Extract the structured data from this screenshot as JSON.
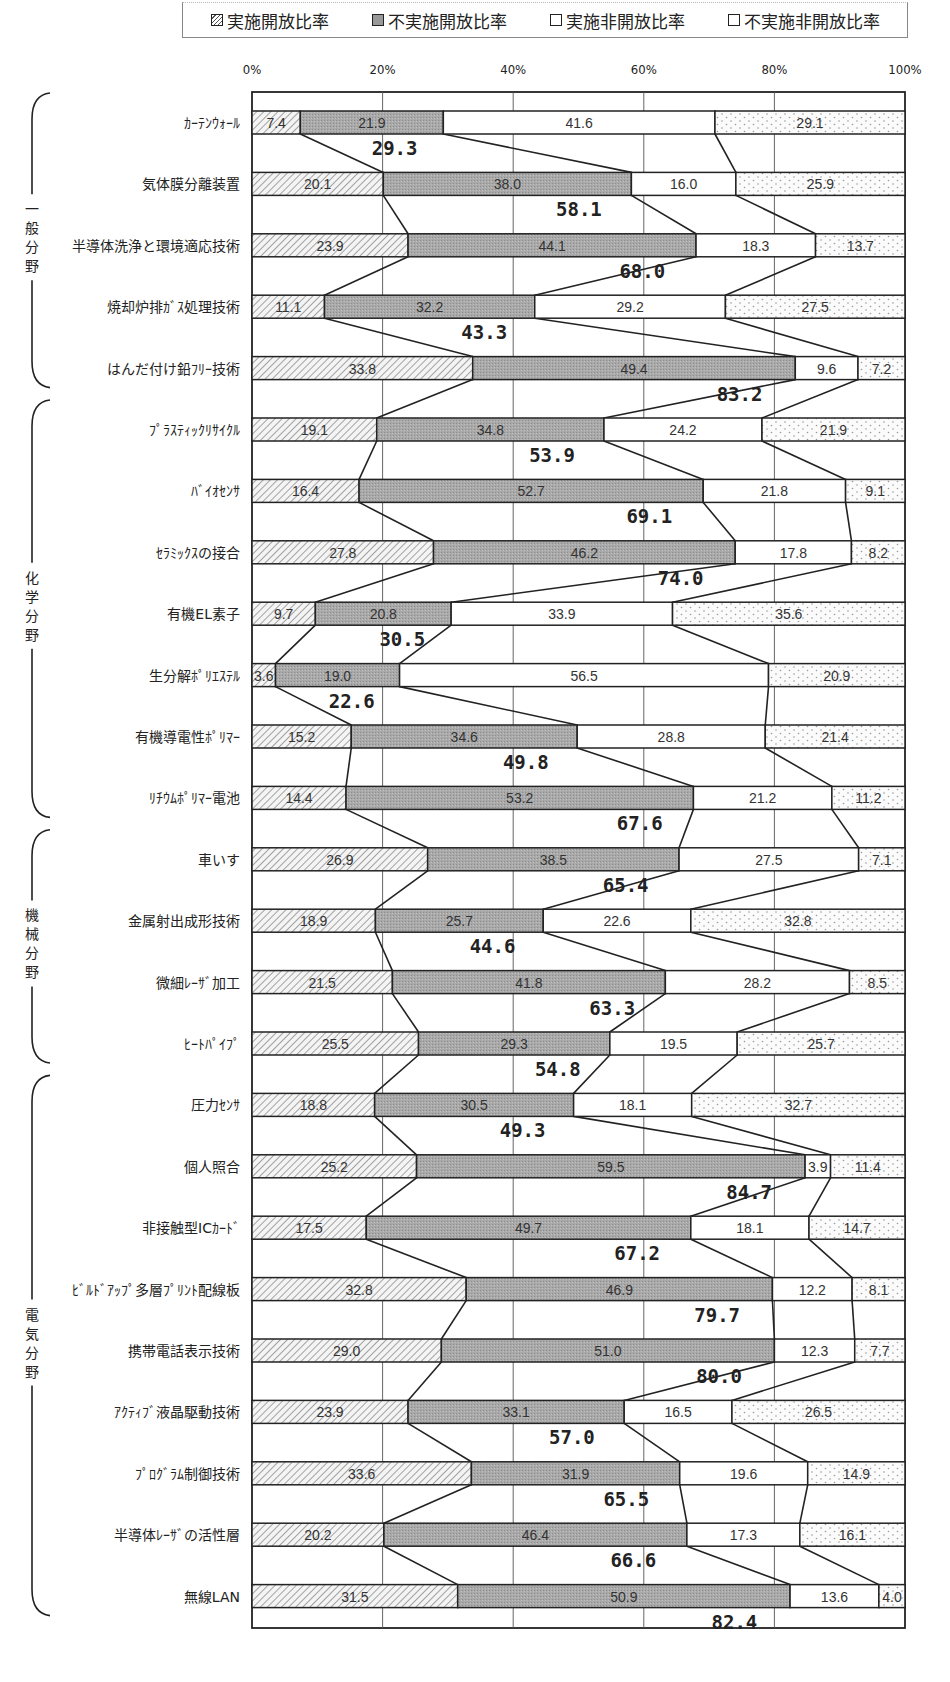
{
  "legend": {
    "items": [
      {
        "label": "実施開放比率",
        "pattern": "hatch"
      },
      {
        "label": "不実施開放比率",
        "pattern": "gray"
      },
      {
        "label": "実施非開放比率",
        "pattern": "white"
      },
      {
        "label": "不実施非開放比率",
        "pattern": "dots"
      }
    ]
  },
  "colors": {
    "hatch_fill": "#f2f2f2",
    "hatch_line": "#777777",
    "gray_fill": "#a8a8a8",
    "white_fill": "#ffffff",
    "dots_fill": "#fafafa",
    "dots_color": "#9a9a9a",
    "line": "#222222",
    "grid": "#444444"
  },
  "chart_data": {
    "type": "bar",
    "orientation": "horizontal",
    "stacked": "percent",
    "title": "",
    "xlabel": "",
    "ylabel": "",
    "xlim": [
      0,
      100
    ],
    "x_ticks": [
      "0%",
      "20%",
      "40%",
      "60%",
      "80%",
      "100%"
    ],
    "grid": true,
    "legend_position": "top",
    "series_names": [
      "実施開放比率",
      "不実施開放比率",
      "実施非開放比率",
      "不実施非開放比率"
    ],
    "annotation": "Bold numbers below each bar = 実施開放比率 + 不実施開放比率 (開放比率合計)",
    "groups": [
      {
        "label": "一般分野",
        "start": 0,
        "end": 4
      },
      {
        "label": "化学分野",
        "start": 5,
        "end": 11
      },
      {
        "label": "機械分野",
        "start": 12,
        "end": 15
      },
      {
        "label": "電気分野",
        "start": 16,
        "end": 24
      }
    ],
    "categories": [
      "ｶｰﾃﾝｳｫｰﾙ",
      "気体膜分離装置",
      "半導体洗浄と環境適応技術",
      "焼却炉排ｶﾞｽ処理技術",
      "はんだ付け鉛ﾌﾘｰ技術",
      "ﾌﾟﾗｽﾃｨｯｸﾘｻｲｸﾙ",
      "ﾊﾞｲｵｾﾝｻ",
      "ｾﾗﾐｯｸｽの接合",
      "有機EL素子",
      "生分解ﾎﾟﾘｴｽﾃﾙ",
      "有機導電性ﾎﾟﾘﾏｰ",
      "ﾘﾁｳﾑﾎﾟﾘﾏｰ電池",
      "車いす",
      "金属射出成形技術",
      "微細ﾚｰｻﾞ加工",
      "ﾋｰﾄﾊﾟｲﾌﾟ",
      "圧力ｾﾝｻ",
      "個人照合",
      "非接触型ICｶｰﾄﾞ",
      "ﾋﾞﾙﾄﾞｱｯﾌﾟ多層ﾌﾟﾘﾝﾄ配線板",
      "携帯電話表示技術",
      "ｱｸﾃｨﾌﾞ液晶駆動技術",
      "ﾌﾟﾛｸﾞﾗﾑ制御技術",
      "半導体ﾚｰｻﾞの活性層",
      "無線LAN"
    ],
    "series": [
      {
        "name": "実施開放比率",
        "values": [
          7.4,
          20.1,
          23.9,
          11.1,
          33.8,
          19.1,
          16.4,
          27.8,
          9.7,
          3.6,
          15.2,
          14.4,
          26.9,
          18.9,
          21.5,
          25.5,
          18.8,
          25.2,
          17.5,
          32.8,
          29.0,
          23.9,
          33.6,
          20.2,
          31.5
        ]
      },
      {
        "name": "不実施開放比率",
        "values": [
          21.9,
          38.0,
          44.1,
          32.2,
          49.4,
          34.8,
          52.7,
          46.2,
          20.8,
          19.0,
          34.6,
          53.2,
          38.5,
          25.7,
          41.8,
          29.3,
          30.5,
          59.5,
          49.7,
          46.9,
          51.0,
          33.1,
          31.9,
          46.4,
          50.9
        ]
      },
      {
        "name": "実施非開放比率",
        "values": [
          41.6,
          16.0,
          18.3,
          29.2,
          9.6,
          24.2,
          21.8,
          17.8,
          33.9,
          56.5,
          28.8,
          21.2,
          27.5,
          22.6,
          28.2,
          19.5,
          18.1,
          3.9,
          18.1,
          12.2,
          12.3,
          16.5,
          19.6,
          17.3,
          13.6
        ]
      },
      {
        "name": "不実施非開放比率",
        "values": [
          29.1,
          25.9,
          13.7,
          27.5,
          7.2,
          21.9,
          9.1,
          8.2,
          35.6,
          20.9,
          21.4,
          11.2,
          7.1,
          32.8,
          8.5,
          25.7,
          32.7,
          11.4,
          14.7,
          8.1,
          7.7,
          26.5,
          14.9,
          16.1,
          4.0
        ]
      }
    ],
    "open_ratio_totals": [
      29.3,
      58.1,
      68.0,
      43.3,
      83.2,
      53.9,
      69.1,
      74.0,
      30.5,
      22.6,
      49.8,
      67.6,
      65.4,
      44.6,
      63.3,
      54.8,
      49.3,
      84.7,
      67.2,
      79.7,
      80.0,
      57.0,
      65.5,
      66.6,
      82.4
    ],
    "segment_labels": [
      [
        "7.4",
        "21.9",
        "41.6",
        "29.1"
      ],
      [
        "20.1",
        "38.0",
        "16.0",
        "25.9"
      ],
      [
        "23.9",
        "44.1",
        "18.3",
        "13.7"
      ],
      [
        "11.1",
        "32.2",
        "29.2",
        "27.5"
      ],
      [
        "33.8",
        "49.4",
        "9.6",
        "7.2"
      ],
      [
        "19.1",
        "34.8",
        "24.2",
        "21.9"
      ],
      [
        "16.4",
        "52.7",
        "21.8",
        "9.1"
      ],
      [
        "27.8",
        "46.2",
        "17.8",
        "8.2"
      ],
      [
        "9.7",
        "20.8",
        "33.9",
        "35.6"
      ],
      [
        "3.6",
        "19.0",
        "56.5",
        "20.9"
      ],
      [
        "15.2",
        "34.6",
        "28.8",
        "21.4"
      ],
      [
        "14.4",
        "53.2",
        "21.2",
        "11.2"
      ],
      [
        "26.9",
        "38.5",
        "27.5",
        "7.1"
      ],
      [
        "18.9",
        "25.7",
        "22.6",
        "32.8"
      ],
      [
        "21.5",
        "41.8",
        "28.2",
        "8.5"
      ],
      [
        "25.5",
        "29.3",
        "19.5",
        "25.7"
      ],
      [
        "18.8",
        "30.5",
        "18.1",
        "32.7"
      ],
      [
        "25.2",
        "59.5",
        "3.9",
        "11.4"
      ],
      [
        "17.5",
        "49.7",
        "18.1",
        "14.7"
      ],
      [
        "32.8",
        "46.9",
        "12.2",
        "8.1"
      ],
      [
        "29.0",
        "51.0",
        "12.3",
        "7.7"
      ],
      [
        "23.9",
        "33.1",
        "16.5",
        "26.5"
      ],
      [
        "33.6",
        "31.9",
        "19.6",
        "14.9"
      ],
      [
        "20.2",
        "46.4",
        "17.3",
        "16.1"
      ],
      [
        "31.5",
        "50.9",
        "13.6",
        "4.0"
      ]
    ]
  }
}
